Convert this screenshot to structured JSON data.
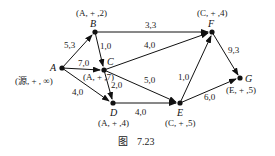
{
  "figure": {
    "caption_prefix": "图",
    "caption_number": "7.23"
  },
  "nodes": [
    {
      "id": "A",
      "name": "A",
      "label": "(源, + , ∞)",
      "x": 62,
      "y": 68
    },
    {
      "id": "B",
      "name": "B",
      "label": "(A, + ,2)",
      "x": 95,
      "y": 32
    },
    {
      "id": "C",
      "name": "C",
      "label": "(A, + ,7)",
      "x": 104,
      "y": 70
    },
    {
      "id": "D",
      "name": "D",
      "label": "(A, + ,4)",
      "x": 113,
      "y": 103
    },
    {
      "id": "E",
      "name": "E",
      "label": "(C, + ,5)",
      "x": 180,
      "y": 103
    },
    {
      "id": "F",
      "name": "F",
      "label": "(C, + ,4)",
      "x": 212,
      "y": 32
    },
    {
      "id": "G",
      "name": "G",
      "label": "(E, + ,5)",
      "x": 240,
      "y": 78
    }
  ],
  "edges": [
    {
      "from": "A",
      "to": "B",
      "label": "5,3"
    },
    {
      "from": "A",
      "to": "C",
      "label": "7,0"
    },
    {
      "from": "A",
      "to": "D",
      "label": "4,0"
    },
    {
      "from": "B",
      "to": "C",
      "label": "1,0"
    },
    {
      "from": "B",
      "to": "F",
      "label": "3,3"
    },
    {
      "from": "C",
      "to": "F",
      "label": "4,0"
    },
    {
      "from": "C",
      "to": "D",
      "label": "2,0"
    },
    {
      "from": "C",
      "to": "E",
      "label": "5,0"
    },
    {
      "from": "D",
      "to": "E",
      "label": "4,0"
    },
    {
      "from": "E",
      "to": "F",
      "label": "1,0"
    },
    {
      "from": "E",
      "to": "G",
      "label": "6,0"
    },
    {
      "from": "F",
      "to": "G",
      "label": "9,3"
    }
  ]
}
